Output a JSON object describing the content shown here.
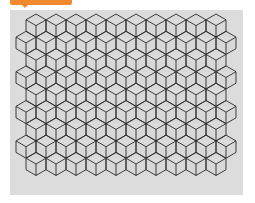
{
  "header": {
    "accent_color": "#f08a2c"
  },
  "figure": {
    "background_color": "#dcdcdc",
    "line_color": "#2a2a2a",
    "face_color": "#d8d8d8",
    "columns": 10,
    "rows": 10
  }
}
